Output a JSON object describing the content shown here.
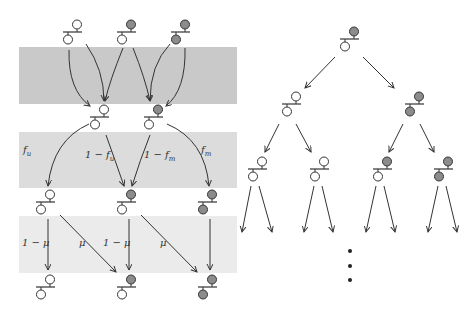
{
  "colors": {
    "band_dark": "#c9c9c9",
    "band_medium": "#dcdcdc",
    "band_light": "#ebebeb",
    "filled_allele": "#8c8c8c",
    "empty_allele": "#ffffff",
    "stroke": "#333333"
  },
  "bands": [
    {
      "name": "band-recombination",
      "x": 19,
      "y": 47,
      "w": 218,
      "h": 57,
      "color": "band_dark"
    },
    {
      "name": "band-selection",
      "x": 19,
      "y": 132,
      "w": 218,
      "h": 56,
      "color": "band_medium"
    },
    {
      "name": "band-mutation",
      "x": 19,
      "y": 216,
      "w": 218,
      "h": 57,
      "color": "band_light"
    }
  ],
  "left_diagram": {
    "parents": [
      {
        "x": 73,
        "y": 20,
        "top": "empty",
        "bottom": "empty"
      },
      {
        "x": 127,
        "y": 20,
        "top": "filled",
        "bottom": "empty"
      },
      {
        "x": 181,
        "y": 20,
        "top": "filled",
        "bottom": "filled"
      }
    ],
    "offspring": [
      {
        "x": 100,
        "y": 105,
        "top": "empty",
        "bottom": "empty"
      },
      {
        "x": 154,
        "y": 105,
        "top": "filled",
        "bottom": "empty"
      }
    ],
    "selected": [
      {
        "x": 46,
        "y": 190,
        "top": "empty",
        "bottom": "empty"
      },
      {
        "x": 127,
        "y": 190,
        "top": "filled",
        "bottom": "empty"
      },
      {
        "x": 208,
        "y": 190,
        "top": "filled",
        "bottom": "filled"
      }
    ],
    "mutated": [
      {
        "x": 46,
        "y": 275,
        "top": "empty",
        "bottom": "empty"
      },
      {
        "x": 127,
        "y": 275,
        "top": "filled",
        "bottom": "empty"
      },
      {
        "x": 208,
        "y": 275,
        "top": "filled",
        "bottom": "filled"
      }
    ],
    "labels": {
      "f_u": "f",
      "f_u_sub": "u",
      "one_minus_f_u": "1 − f",
      "one_minus_f_u_sub": "u",
      "one_minus_f_m": "1 − f",
      "one_minus_f_m_sub": "m",
      "f_m": "f",
      "f_m_sub": "m",
      "one_minus_mu_1": "1 − μ",
      "mu_1": "μ",
      "one_minus_mu_2": "1 − μ",
      "mu_2": "μ"
    }
  },
  "right_tree": {
    "root": {
      "x": 350,
      "y": 27,
      "top": "filled",
      "bottom": "empty"
    },
    "level1": [
      {
        "x": 292,
        "y": 92,
        "top": "empty",
        "bottom": "empty"
      },
      {
        "x": 415,
        "y": 92,
        "top": "filled",
        "bottom": "filled"
      }
    ],
    "level2": [
      {
        "x": 258,
        "y": 157,
        "top": "empty",
        "bottom": "empty"
      },
      {
        "x": 320,
        "y": 157,
        "top": "empty",
        "bottom": "empty"
      },
      {
        "x": 383,
        "y": 157,
        "top": "filled",
        "bottom": "empty"
      },
      {
        "x": 444,
        "y": 157,
        "top": "filled",
        "bottom": "filled"
      }
    ],
    "ellipsis": "⋮"
  }
}
